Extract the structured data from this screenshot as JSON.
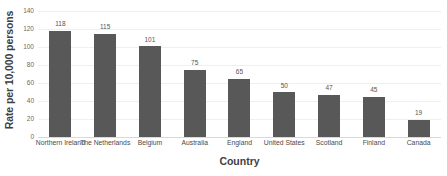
{
  "chart_data": {
    "type": "bar",
    "title": "",
    "xlabel": "Country",
    "ylabel": "Rate per 10,000 persons",
    "categories": [
      "Northern Ireland",
      "The Netherlands",
      "Belgium",
      "Australia",
      "England",
      "United States",
      "Scotland",
      "Finland",
      "Canada"
    ],
    "values": [
      118,
      115,
      101,
      75,
      65,
      50,
      47,
      45,
      19
    ],
    "data_labels": [
      "118",
      "115",
      "101",
      "75",
      "65",
      "50",
      "47",
      "45",
      "19"
    ],
    "ylim": [
      0,
      140
    ],
    "yticks": [
      0,
      20,
      40,
      60,
      80,
      100,
      120,
      140
    ],
    "ytick_labels": [
      "0",
      "20",
      "40",
      "60",
      "80",
      "100",
      "120",
      "140"
    ],
    "grid": true,
    "grid_axis": "y",
    "legend": false,
    "bar_color": "#585858",
    "gridline_color": "#efefef",
    "baseline_color": "#d9d9d9",
    "background_color": "#ffffff",
    "text_color": "#404040"
  }
}
